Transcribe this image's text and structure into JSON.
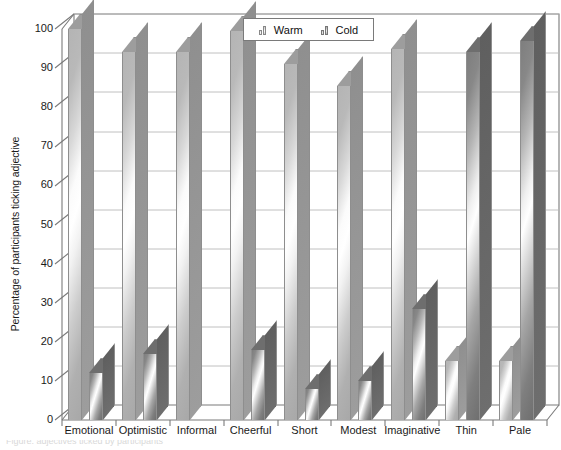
{
  "chart_data": {
    "type": "bar",
    "title": "",
    "subtitle": "",
    "xlabel": "",
    "ylabel": "Percentage of participants ticking adjective",
    "categories": [
      "Emotional",
      "Optimistic",
      "Informal",
      "Cheerful",
      "Short",
      "Modest",
      "Imaginative",
      "Thin",
      "Pale"
    ],
    "series": [
      {
        "name": "Warm",
        "values": [
          100,
          94,
          94,
          99.5,
          91,
          85.5,
          95,
          15,
          15
        ]
      },
      {
        "name": "Cold",
        "values": [
          12,
          17,
          0,
          18,
          8,
          10,
          28.5,
          94,
          97
        ]
      }
    ],
    "series_order_by_category": [
      [
        "Warm",
        "Cold"
      ],
      [
        "Warm",
        "Cold"
      ],
      [
        "Warm",
        "Cold"
      ],
      [
        "Warm",
        "Cold"
      ],
      [
        "Warm",
        "Cold"
      ],
      [
        "Warm",
        "Cold"
      ],
      [
        "Warm",
        "Cold"
      ],
      [
        "Warm",
        "Cold"
      ],
      [
        "Warm",
        "Cold"
      ]
    ],
    "ylim": [
      0,
      100
    ],
    "yticks": [
      0,
      10,
      20,
      30,
      40,
      50,
      60,
      70,
      80,
      90,
      100
    ],
    "ytick_labels": [
      "0",
      "10",
      "20",
      "30",
      "40",
      "50",
      "60",
      "70",
      "80",
      "90",
      "100"
    ],
    "grid": true,
    "grid_axis": "y",
    "legend_position": "top-center",
    "style": "3d-column-gradient"
  },
  "legend": {
    "entries": [
      {
        "label": "Warm",
        "icon": "bar-series-icon",
        "color": "#b4b4b4"
      },
      {
        "label": "Cold",
        "icon": "bar-series-icon",
        "color": "#7e7e7e"
      }
    ]
  },
  "axes": {
    "y_title": "Percentage of participants ticking adjective"
  },
  "caption": {
    "artifact_text": "Figure: adjectives ticked by participants"
  }
}
